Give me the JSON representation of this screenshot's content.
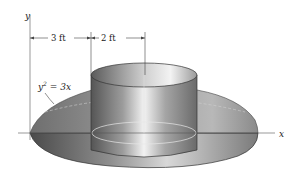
{
  "figure": {
    "type": "solid-of-revolution",
    "labels": {
      "y_axis": "y",
      "x_axis": "x",
      "dim_left": "3 ft",
      "dim_right": "2 ft",
      "equation_lhs": "y",
      "equation_exp": "2",
      "equation_rhs": " = 3x"
    },
    "colors": {
      "background": "#ffffff",
      "outer_dark": "#5e5e5e",
      "outer_mid": "#8a8a8a",
      "outer_light": "#d8d8d8",
      "cylinder_dark": "#6a6a6a",
      "cylinder_light": "#eeeeee",
      "lines": "#333333"
    }
  }
}
